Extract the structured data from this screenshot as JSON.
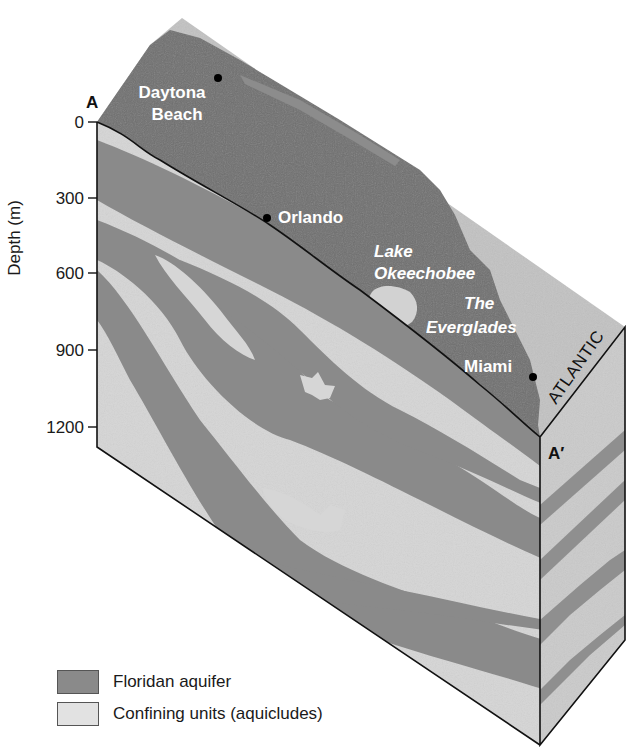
{
  "figure": {
    "type": "block-diagram"
  },
  "axis": {
    "label": "Depth (m)",
    "ticks": [
      "0",
      "300",
      "600",
      "900",
      "1200"
    ]
  },
  "section": {
    "start_label": "A",
    "end_label": "A′"
  },
  "places": {
    "daytona_line1": "Daytona",
    "daytona_line2": "Beach",
    "orlando": "Orlando",
    "lake_line1": "Lake",
    "lake_line2": "Okeechobee",
    "everglades_line1": "The",
    "everglades_line2": "Everglades",
    "miami": "Miami",
    "ocean": "ATLANTIC"
  },
  "legend": {
    "items": [
      {
        "label": "Floridan aquifer",
        "color": "#8a8a8a"
      },
      {
        "label": "Confining units (aquicludes)",
        "color": "#d9d9d9"
      }
    ]
  },
  "colors": {
    "aquifer": "#8a8a8a",
    "confining": "#d6d6d6",
    "land_surface": "#6e6e6e",
    "ocean_surface": "#bdbdbd",
    "right_face": "#c8c8c8",
    "outline": "#111111"
  }
}
